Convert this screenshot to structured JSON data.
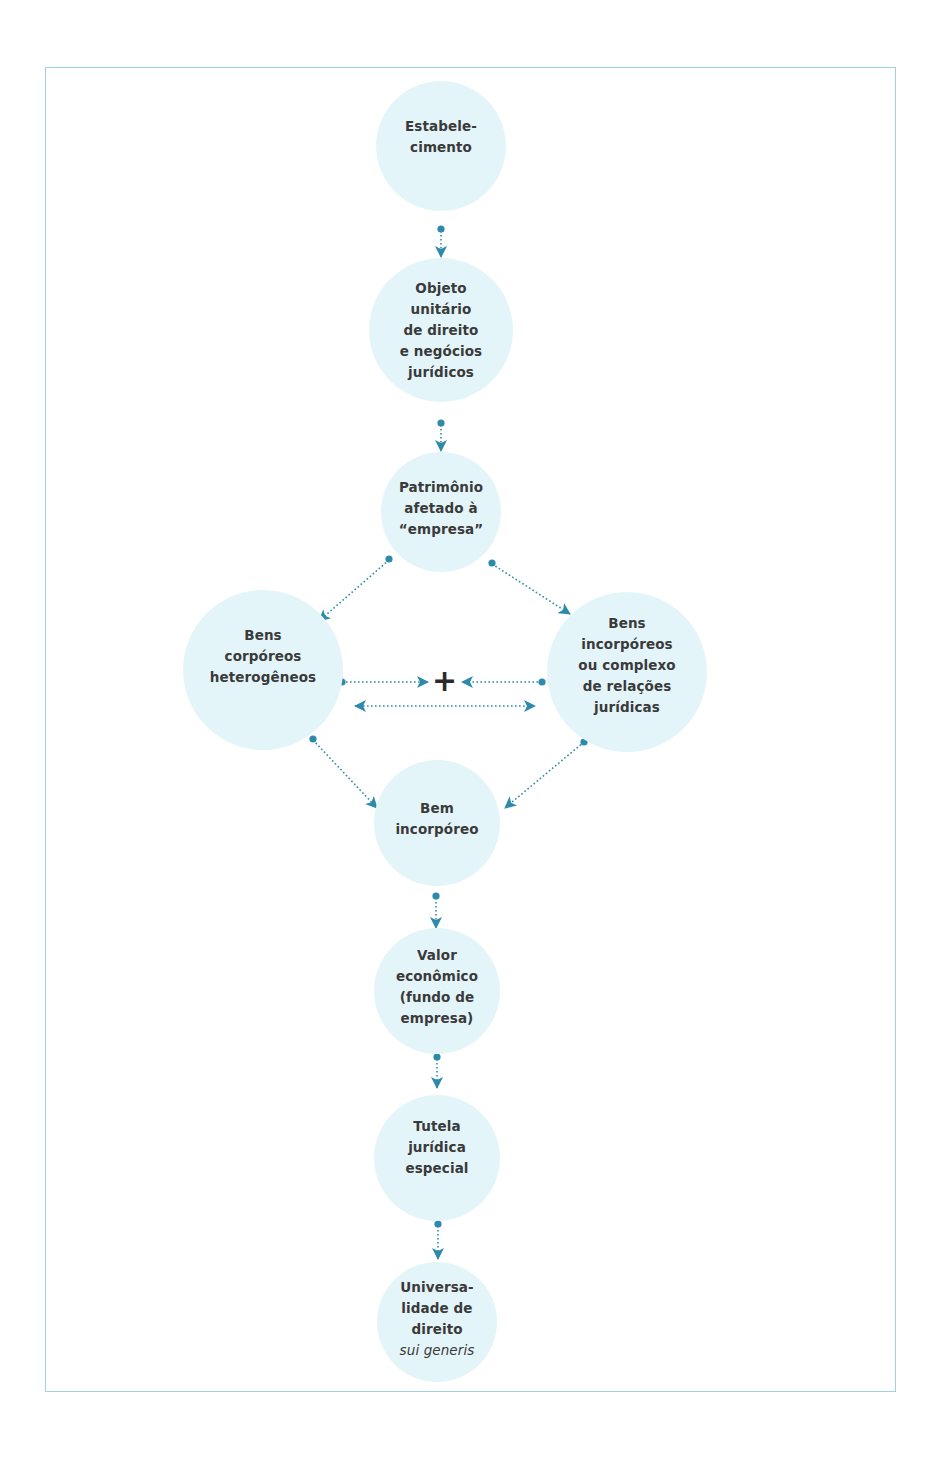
{
  "diagram": {
    "type": "flowchart",
    "colors": {
      "node_fill": "#e4f5fa",
      "connector": "#2e8aab",
      "frame": "#9fd3e3",
      "text": "#3a3a3a"
    },
    "nodes": [
      {
        "id": "estabelecimento",
        "label": "Estabele-\ncimento"
      },
      {
        "id": "objeto-unitario",
        "label": "Objeto\nunitário\nde direito\ne negócios\njurídicos"
      },
      {
        "id": "patrimonio",
        "label": "Patrimônio\nafetado à\n“empresa”"
      },
      {
        "id": "bens-corporeos",
        "label": "Bens\ncorpóreos\nheterogêneos"
      },
      {
        "id": "bens-incorporeos",
        "label": "Bens\nincorpóreos\nou complexo\nde relações\njurídicas"
      },
      {
        "id": "bem-incorporeo",
        "label": "Bem\nincorpóreo"
      },
      {
        "id": "valor-economico",
        "label": "Valor\neconômico\n(fundo de\nempresa)"
      },
      {
        "id": "tutela",
        "label": "Tutela\njurídica\nespecial"
      },
      {
        "id": "universalidade",
        "label": "Universa-\nlidade de\ndireito",
        "italic_suffix": "sui generis"
      }
    ],
    "combine_symbol": "+",
    "edges": [
      {
        "from": "estabelecimento",
        "to": "objeto-unitario"
      },
      {
        "from": "objeto-unitario",
        "to": "patrimonio"
      },
      {
        "from": "patrimonio",
        "to": "bens-corporeos"
      },
      {
        "from": "patrimonio",
        "to": "bens-incorporeos"
      },
      {
        "from": "bens-corporeos",
        "to": "plus"
      },
      {
        "from": "bens-incorporeos",
        "to": "plus"
      },
      {
        "from": "bens-corporeos",
        "to": "bens-incorporeos",
        "bidirectional": true
      },
      {
        "from": "bens-corporeos",
        "to": "bem-incorporeo"
      },
      {
        "from": "bens-incorporeos",
        "to": "bem-incorporeo"
      },
      {
        "from": "bem-incorporeo",
        "to": "valor-economico"
      },
      {
        "from": "valor-economico",
        "to": "tutela"
      },
      {
        "from": "tutela",
        "to": "universalidade"
      }
    ]
  }
}
